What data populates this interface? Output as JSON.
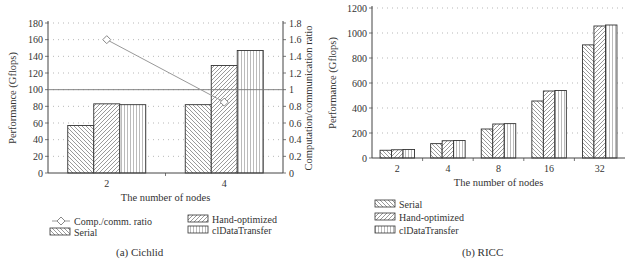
{
  "chart_data": [
    {
      "type": "bar",
      "panel": "a",
      "caption": "(a) Cichlid",
      "title": "",
      "xlabel": "The number of nodes",
      "ylabel": "Performance (Gflops)",
      "y2label": "Computation/communication ratio",
      "categories": [
        "2",
        "4"
      ],
      "ylim": [
        0,
        180
      ],
      "yticks": [
        0,
        20,
        40,
        60,
        80,
        100,
        120,
        140,
        160,
        180
      ],
      "y2lim": [
        0,
        1.8
      ],
      "y2ticks": [
        "0",
        "0.2",
        "0.4",
        "0.6",
        "0.8",
        "1",
        "1.2",
        "1.4",
        "1.6",
        "1.8"
      ],
      "grid": "horizontal dotted",
      "reference_line": {
        "axis": "y2",
        "value": 1
      },
      "series": [
        {
          "name": "Serial",
          "pattern": "back-diagonal",
          "values": [
            57,
            82
          ]
        },
        {
          "name": "Hand-optimized",
          "pattern": "forward-diagonal",
          "values": [
            83,
            129
          ]
        },
        {
          "name": "clDataTransfer",
          "pattern": "vertical",
          "values": [
            82,
            147
          ]
        },
        {
          "name": "Comp./comm. ratio",
          "type": "line",
          "axis": "y2",
          "marker": "diamond",
          "values": [
            1.6,
            0.85
          ]
        }
      ],
      "legend": {
        "position": "bottom",
        "entries": [
          "Comp./comm. ratio",
          "Hand-optimized",
          "Serial",
          "clDataTransfer"
        ]
      }
    },
    {
      "type": "bar",
      "panel": "b",
      "caption": "(b) RICC",
      "title": "",
      "xlabel": "The number of nodes",
      "ylabel": "Performance (Gflops)",
      "categories": [
        "2",
        "4",
        "8",
        "16",
        "32"
      ],
      "ylim": [
        0,
        1200
      ],
      "yticks": [
        0,
        200,
        400,
        600,
        800,
        1000,
        1200
      ],
      "grid": "horizontal dotted",
      "series": [
        {
          "name": "Serial",
          "pattern": "back-diagonal",
          "values": [
            62,
            115,
            232,
            456,
            905
          ]
        },
        {
          "name": "Hand-optimized",
          "pattern": "forward-diagonal",
          "values": [
            66,
            138,
            272,
            536,
            1056
          ]
        },
        {
          "name": "clDataTransfer",
          "pattern": "vertical",
          "values": [
            68,
            140,
            275,
            540,
            1064
          ]
        }
      ],
      "legend": {
        "position": "bottom",
        "entries": [
          "Serial",
          "Hand-optimized",
          "clDataTransfer"
        ]
      }
    }
  ]
}
